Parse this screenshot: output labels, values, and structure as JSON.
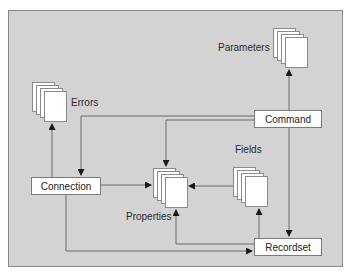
{
  "diagram": {
    "colors": {
      "frame_fill": "#d3d3d3",
      "frame_border": "#8a8a8a",
      "box_fill": "#ffffff",
      "line": "#666666"
    },
    "nodes": {
      "command": {
        "label": "Command",
        "type": "object"
      },
      "connection": {
        "label": "Connection",
        "type": "object"
      },
      "recordset": {
        "label": "Recordset",
        "type": "object"
      },
      "errors": {
        "label": "Errors",
        "type": "collection"
      },
      "parameters": {
        "label": "Parameters",
        "type": "collection"
      },
      "properties": {
        "label": "Properties",
        "type": "collection"
      },
      "fields": {
        "label": "Fields",
        "type": "collection"
      }
    },
    "edges": [
      {
        "from": "Connection",
        "to": "Errors"
      },
      {
        "from": "Connection",
        "to": "Properties"
      },
      {
        "from": "Connection",
        "to": "Recordset"
      },
      {
        "from": "Command",
        "to": "Parameters"
      },
      {
        "from": "Command",
        "to": "Connection"
      },
      {
        "from": "Command",
        "to": "Properties"
      },
      {
        "from": "Command",
        "to": "Recordset"
      },
      {
        "from": "Fields",
        "to": "Properties"
      },
      {
        "from": "Recordset",
        "to": "Fields"
      },
      {
        "from": "Recordset",
        "to": "Properties"
      }
    ]
  }
}
